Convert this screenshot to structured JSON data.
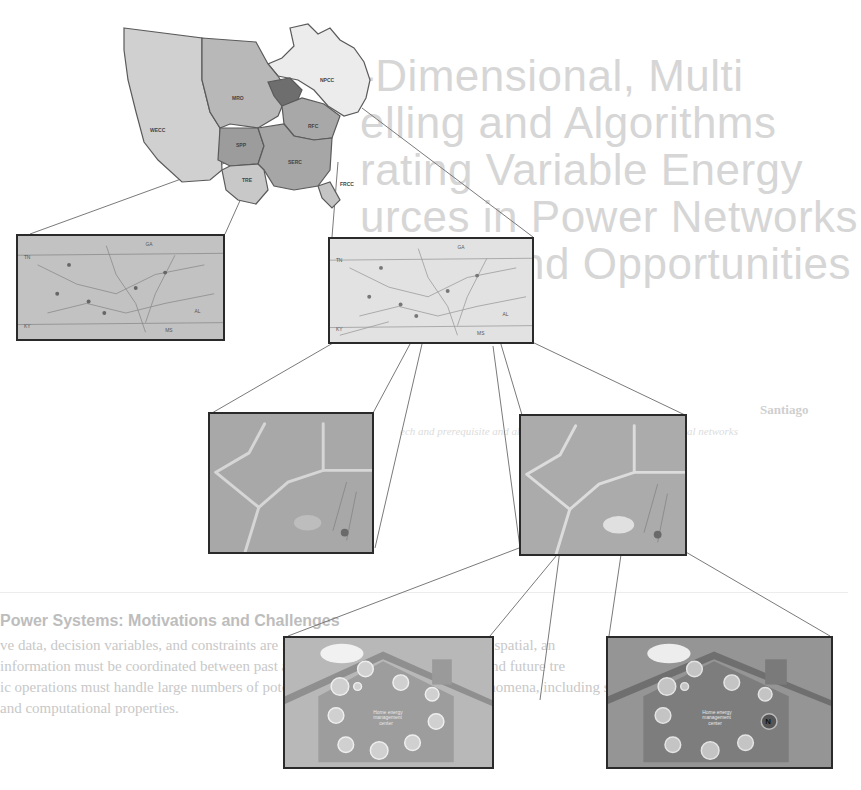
{
  "figure": {
    "levels": [
      {
        "level": "continental",
        "label": "North American interconnection map",
        "regions": [
          "WECC",
          "MRO",
          "NPCC",
          "SPP",
          "RFC",
          "SERC",
          "TRE",
          "FRCC"
        ]
      },
      {
        "level": "regional",
        "panels": [
          {
            "name": "regional-grid-map-left",
            "labels": [
              "TN",
              "AL",
              "GA",
              "KY",
              "MS"
            ]
          },
          {
            "name": "regional-grid-map-right",
            "labels": [
              "TN",
              "AL",
              "GA",
              "KY",
              "MS"
            ]
          }
        ]
      },
      {
        "level": "distribution",
        "panels": [
          {
            "name": "neighborhood-map-left"
          },
          {
            "name": "neighborhood-map-right"
          }
        ]
      },
      {
        "level": "household",
        "panels": [
          {
            "name": "smart-home-left",
            "center_text": [
              "Home energy",
              "management",
              "center"
            ]
          },
          {
            "name": "smart-home-right",
            "center_text": [
              "Home energy",
              "management",
              "center"
            ]
          }
        ]
      }
    ]
  },
  "background_page": {
    "title_lines": [
      "-Dimensional, Multi",
      "elling and Algorithms",
      "rating Variable Energy",
      "urces in Power Networks",
      "enges and Opportunities"
    ],
    "author": "Santiago",
    "affiliation": "ech and prerequisite and ability to support state data and technical networks",
    "section_heading": "Power Systems: Motivations and Challenges",
    "body_lines": [
      "ve data, decision variables, and constraints are increasingly multi-scale: temporal, spatial, an",
      "information must be coordinated between past and present operating conditions, and future tre",
      "ic operations must handle large numbers of potential, uncertain, and complex phenomena, including sparsit",
      "and computational properties."
    ]
  },
  "colors": {
    "frame": "#2a2a2a",
    "connector": "#7a7a7a",
    "map_light": "#e6e6e6",
    "map_mid": "#c9c9c9",
    "map_dark": "#a9a9a9",
    "house_bg_light": "#b5b5b5",
    "house_bg_dark": "#8e8e8e"
  }
}
